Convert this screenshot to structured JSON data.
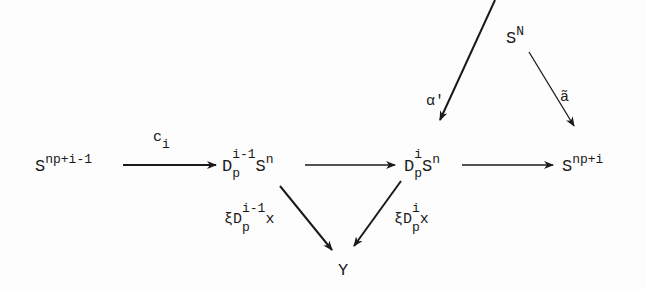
{
  "diagram": {
    "type": "commutative-diagram",
    "nodes": {
      "s_np_i_minus_1": {
        "base": "S",
        "sup": "np+i-1"
      },
      "dp_i_minus_1_sn": {
        "base": "D",
        "sub": "p",
        "sup": "i-1",
        "tail_base": "S",
        "tail_sup": "n"
      },
      "dp_i_sn": {
        "base": "D",
        "sub": "p",
        "sup": "i",
        "tail_base": "S",
        "tail_sup": "n"
      },
      "s_np_i": {
        "base": "S",
        "sup": "np+i"
      },
      "s_N": {
        "base": "S",
        "sup": "N"
      },
      "y": {
        "base": "Y"
      }
    },
    "edges": [
      {
        "from": "s_np_i_minus_1",
        "to": "dp_i_minus_1_sn",
        "label": {
          "base": "c",
          "sub": "i"
        }
      },
      {
        "from": "dp_i_minus_1_sn",
        "to": "dp_i_sn",
        "label": null
      },
      {
        "from": "dp_i_sn",
        "to": "s_np_i",
        "label": null
      },
      {
        "from": "s_N",
        "to": "dp_i_sn",
        "label": {
          "base": "α'"
        }
      },
      {
        "from": "s_N",
        "to": "s_np_i",
        "label": {
          "base": "ã"
        }
      },
      {
        "from": "dp_i_minus_1_sn",
        "to": "y",
        "label": {
          "prefix": "ξD",
          "sub": "p",
          "sup": "i-1",
          "tail": "x"
        }
      },
      {
        "from": "dp_i_sn",
        "to": "y",
        "label": {
          "prefix": "ξD",
          "sub": "p",
          "sup": "i",
          "tail": "x"
        }
      }
    ]
  },
  "colors": {
    "ink": "#1a1a1a",
    "background": "#fdfdfd"
  }
}
